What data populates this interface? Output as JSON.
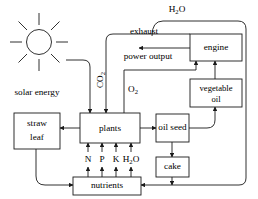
{
  "diagram": {
    "colors": {
      "stroke": "#1a1a1a",
      "background": "#ffffff",
      "text": "#000000"
    },
    "nodes": [
      {
        "id": "plants",
        "label": "plants"
      },
      {
        "id": "straw_leaf",
        "label_line1": "straw",
        "label_line2": "leaf"
      },
      {
        "id": "oil_seed",
        "label": "oil seed"
      },
      {
        "id": "cake",
        "label": "cake"
      },
      {
        "id": "nutrients",
        "label": "nutrients"
      },
      {
        "id": "engine",
        "label": "engine"
      },
      {
        "id": "vegetable_oil",
        "label_line1": "vegetable",
        "label_line2": "oil"
      }
    ],
    "edge_labels": {
      "solar_energy": "solar energy",
      "co2": "CO",
      "co2_sub": "2",
      "o2": "O",
      "o2_sub": "2",
      "exhaust": "exhaust",
      "power_output": "power output",
      "h2o_top": "H",
      "h2o_top_sub": "2",
      "h2o_top_tail": "O"
    },
    "nutrient_inputs": [
      {
        "symbol": "N"
      },
      {
        "symbol": "P"
      },
      {
        "symbol": "K"
      },
      {
        "symbol": "H",
        "sub": "2",
        "tail": "O"
      }
    ],
    "icons": {
      "sun": "sun-icon"
    }
  }
}
